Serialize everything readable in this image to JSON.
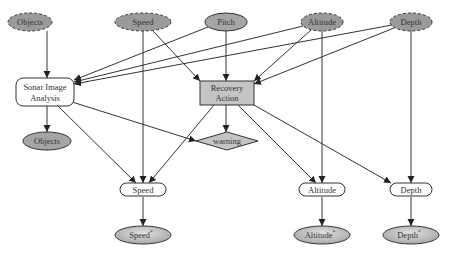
{
  "diagram": {
    "colors": {
      "background": "#ffffff",
      "node_dark": "#9a9a9a",
      "node_medium": "#b8b8b8",
      "node_light": "#c8c8c8",
      "node_white": "#ffffff",
      "stroke": "#333333"
    },
    "nodes": {
      "objects_in": {
        "label": "Objects",
        "shape": "ellipse",
        "style": "dashed",
        "x": 30,
        "y": 22,
        "rx": 22,
        "ry": 9
      },
      "speed_in": {
        "label": "Speed",
        "shape": "ellipse",
        "style": "dashed",
        "x": 143,
        "y": 22,
        "rx": 28,
        "ry": 9
      },
      "pitch_in": {
        "label": "Pitch",
        "shape": "ellipse",
        "style": "solid",
        "x": 226,
        "y": 22,
        "rx": 21,
        "ry": 9
      },
      "altitude_in": {
        "label": "Altitude",
        "shape": "ellipse",
        "style": "dashed",
        "x": 322,
        "y": 22,
        "rx": 21,
        "ry": 9
      },
      "depth_in": {
        "label": "Depth",
        "shape": "ellipse",
        "style": "dashed",
        "x": 411,
        "y": 22,
        "rx": 21,
        "ry": 9
      },
      "sonar": {
        "label_line1": "Sonar Image",
        "label_line2": "Analysis",
        "shape": "roundrect",
        "x": 42,
        "y": 92,
        "w": 52,
        "h": 28
      },
      "recovery": {
        "label_line1": "Recovery",
        "label_line2": "Action",
        "shape": "rect",
        "x": 227,
        "y": 93,
        "w": 54,
        "h": 24
      },
      "objects_out": {
        "label": "Objects",
        "shape": "ellipse",
        "x": 47,
        "y": 141,
        "rx": 24,
        "ry": 9
      },
      "warning": {
        "label": "warning",
        "shape": "diamond",
        "x": 227,
        "y": 141,
        "rx": 31,
        "ry": 9
      },
      "speed_mid": {
        "label": "Speed",
        "shape": "pill",
        "x": 143,
        "y": 190,
        "w": 46,
        "h": 13
      },
      "altitude_mid": {
        "label": "Altitude",
        "shape": "pill",
        "x": 322,
        "y": 190,
        "w": 46,
        "h": 13
      },
      "depth_mid": {
        "label": "Depth",
        "shape": "pill",
        "x": 411,
        "y": 190,
        "w": 42,
        "h": 13
      },
      "speed_out": {
        "label": "Speed",
        "sup": "*",
        "shape": "ellipse",
        "x": 143,
        "y": 235,
        "rx": 28,
        "ry": 9
      },
      "altitude_out": {
        "label": "Altitude",
        "sup": "*",
        "shape": "ellipse",
        "x": 322,
        "y": 235,
        "rx": 28,
        "ry": 9
      },
      "depth_out": {
        "label": "Depth",
        "sup": "*",
        "shape": "ellipse",
        "x": 411,
        "y": 235,
        "rx": 28,
        "ry": 9
      }
    },
    "edges": [
      {
        "from": "objects_in",
        "to": "sonar",
        "points": [
          [
            47,
            31
          ],
          [
            47,
            78
          ]
        ]
      },
      {
        "from": "speed_in",
        "to": "recovery",
        "points": [
          [
            153,
            31
          ],
          [
            200,
            81
          ]
        ]
      },
      {
        "from": "speed_in",
        "to": "speed_mid",
        "points": [
          [
            143,
            31
          ],
          [
            143,
            183
          ]
        ]
      },
      {
        "from": "pitch_in",
        "to": "sonar",
        "points": [
          [
            208,
            27
          ],
          [
            74,
            80
          ]
        ]
      },
      {
        "from": "pitch_in",
        "to": "recovery",
        "points": [
          [
            226,
            31
          ],
          [
            226,
            81
          ]
        ]
      },
      {
        "from": "altitude_in",
        "to": "sonar",
        "points": [
          [
            303,
            26
          ],
          [
            74,
            82
          ]
        ]
      },
      {
        "from": "altitude_in",
        "to": "recovery",
        "points": [
          [
            311,
            30
          ],
          [
            254,
            81
          ]
        ]
      },
      {
        "from": "altitude_in",
        "to": "altitude_mid",
        "points": [
          [
            322,
            31
          ],
          [
            322,
            183
          ]
        ]
      },
      {
        "from": "depth_in",
        "to": "sonar",
        "points": [
          [
            392,
            25
          ],
          [
            74,
            84
          ]
        ]
      },
      {
        "from": "depth_in",
        "to": "recovery",
        "points": [
          [
            394,
            28
          ],
          [
            254,
            84
          ]
        ]
      },
      {
        "from": "depth_in",
        "to": "depth_mid",
        "points": [
          [
            411,
            31
          ],
          [
            411,
            183
          ]
        ]
      },
      {
        "from": "sonar",
        "to": "objects_out",
        "points": [
          [
            47,
            106
          ],
          [
            47,
            132
          ]
        ]
      },
      {
        "from": "sonar",
        "to": "warning",
        "points": [
          [
            72,
            102
          ],
          [
            196,
            141
          ]
        ]
      },
      {
        "from": "sonar",
        "to": "speed_mid",
        "points": [
          [
            58,
            106
          ],
          [
            136,
            183
          ]
        ]
      },
      {
        "from": "recovery",
        "to": "warning",
        "points": [
          [
            226,
            105
          ],
          [
            226,
            132
          ]
        ]
      },
      {
        "from": "recovery",
        "to": "speed_mid",
        "points": [
          [
            214,
            105
          ],
          [
            149,
            183
          ]
        ]
      },
      {
        "from": "recovery",
        "to": "altitude_mid",
        "points": [
          [
            238,
            105
          ],
          [
            316,
            183
          ]
        ]
      },
      {
        "from": "recovery",
        "to": "depth_mid",
        "points": [
          [
            254,
            105
          ],
          [
            391,
            183
          ]
        ]
      },
      {
        "from": "speed_mid",
        "to": "speed_out",
        "points": [
          [
            143,
            197
          ],
          [
            143,
            226
          ]
        ]
      },
      {
        "from": "altitude_mid",
        "to": "altitude_out",
        "points": [
          [
            322,
            197
          ],
          [
            322,
            226
          ]
        ]
      },
      {
        "from": "depth_mid",
        "to": "depth_out",
        "points": [
          [
            411,
            197
          ],
          [
            411,
            226
          ]
        ]
      }
    ]
  }
}
